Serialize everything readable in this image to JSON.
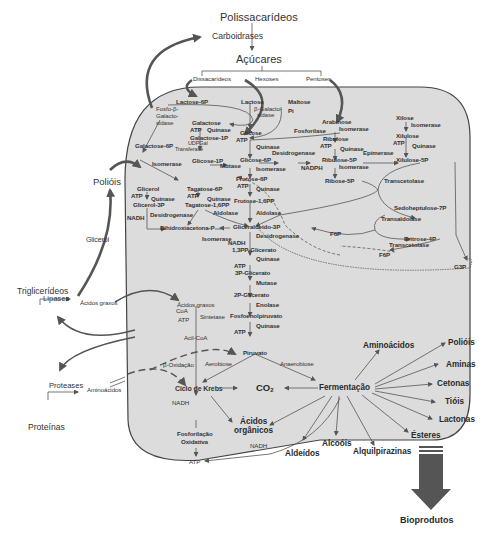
{
  "diagram": {
    "colors": {
      "cell_fill": "#dcdcdc",
      "cell_stroke": "#444444",
      "line": "#555555",
      "arrow_big": "#555555",
      "text": "#2a2a2a"
    },
    "external": {
      "polissacarideos": "Polissacarídeos",
      "carboidrases": "Carboidrases",
      "acucares": "Açúcares",
      "dissacarideos": "Dissacarídeos",
      "hexoses": "Hexoses",
      "pentoses": "Pentoses",
      "poliois": "Polióis",
      "glicerol": "Glicerol",
      "trigliceridios": "Triglicerídeos",
      "lipases": "Lipases",
      "acidos_graxos": "Ácidos graxos",
      "proteases": "Proteases",
      "aminoacidos": "Aminoácidos",
      "proteinas": "Proteínas",
      "bioprodutos": "Bioprodutos"
    },
    "lactose_branch": {
      "lactose_6p": "Lactose-6P",
      "fosfo_beta_galactosidase": [
        "Fosfo-β-",
        "Galacto-",
        "sidase"
      ],
      "galactose": "Galactose",
      "atp1": "ATP",
      "quinase1": "Quinase",
      "galactose_1p": "Galactose-1P",
      "udpgal": "UDPGal",
      "transferase": "Transferase",
      "galactose_6p": "Galactose-6P",
      "isomerase": "Isomerase",
      "lactose": "Lactose",
      "beta_galactosidase": [
        "β-Galacto-",
        "sidase"
      ],
      "maltose": "Maltose",
      "pi": "Pi",
      "fosforilase": "Fosforilase"
    },
    "glycolysis": {
      "glicose": "Glicose",
      "atp_g": "ATP",
      "quinase_g": "Quinase",
      "glicose_1p": "Glicose-1P",
      "mutase_g": "Mutase",
      "glicose_6p": "Glicose-6P",
      "isomerase_g": "Isomerase",
      "frutose_6p": "Frutose-6P",
      "atp_f": "ATP",
      "quinase_f": "Quinase",
      "frutose_16pp": "Frutose-1,6PP",
      "aldolase_f": "Aldolase",
      "gliceraldeido_3p": "Gliceraldeído-3P",
      "desidrogenase_g": "Desidrogenase",
      "nadh_g": "NADH",
      "bpg": "1,3PP-Glicerato",
      "quinase_bpg": "Quinase",
      "atp_bpg": "ATP",
      "pg3": "3P-Glicerato",
      "mutase_pg": "Mutase",
      "pg2": "2P-Glicerato",
      "enolase": "Enolase",
      "pep": "Fosfoenolpiruvato",
      "quinase_pep": "Quinase",
      "atp_pep": "ATP",
      "piruvato": "Piruvato"
    },
    "tagatose_glycerol": {
      "tagatose_6p": "Tagatose-6P",
      "atp_t": "ATP",
      "quinase_t": "Quinase",
      "tagatose_16pp": "Tagatose-1,6PP",
      "aldolase_t": "Aldolase",
      "dihidroxiacetona_p": "Dihidroxiacetona-P",
      "isomerase_d": "Isomerase",
      "glicerol": "Glicerol",
      "atp_gl": "ATP",
      "quinase_gl": "Quinase",
      "glicerol_3p": "Glicerol-3P",
      "nadh_gl": "NADH",
      "desidrogenase_gl": "Desidrogenase"
    },
    "pentose": {
      "desidrogenase_p": "Desidrogenase",
      "nadph": "NADPH",
      "arabinose": "Arabinose",
      "isomerase_a": "Isomerase",
      "ribulose": "Ribulose",
      "atp_r": "ATP",
      "quinase_r": "Quinase",
      "ribulose_5p": "Ribulose-5P",
      "isomerase_r": "Isomerase",
      "ribose_5p": "Ribose-5P",
      "epimerase": "Epimerase",
      "xilose": "Xilose",
      "isomerase_x": "Isomerase",
      "xilulose": "Xilulose",
      "atp_x": "ATP",
      "quinase_x": "Quinase",
      "xilulose_5p": "Xilulose-5P",
      "transcetolase1": "Transcetolase",
      "sedoheptulose_7p": "Sedoheptulose-7P",
      "transaldolase": "Transaldolase",
      "eritrose_4p": "Eritrose-4P",
      "transcetolase2": "Transcetolase",
      "f6p_1": "F6P",
      "f6p_2": "F6P",
      "g3p": "G3P"
    },
    "lipid": {
      "acidos_graxos": "Ácidos graxos",
      "coa": "CoA",
      "atp_l": "ATP",
      "sintetase": "Sintetase",
      "acil_coa": "Acil-CoA",
      "beta_oxidacao": "β-Oxidação"
    },
    "central": {
      "aerobiose": "Aerobiose",
      "anaerobiose": "Anaerobiose",
      "ciclo_krebs": "Ciclo de Krebs",
      "co2": "CO",
      "co2_sub": "2",
      "fermentacao": "Fermentação",
      "nadh_k": "NADH",
      "fosforilacao": [
        "Fosforilação",
        "Oxidativa"
      ],
      "atp_final": "ATP",
      "acidos_organicos": [
        "Ácidos",
        "orgânicos"
      ],
      "nadh_o": "NADH"
    },
    "products": {
      "aminoacidos": "Aminoácidos",
      "poliois": "Polióis",
      "aminas": "Aminas",
      "cetonas": "Cetonas",
      "tiois": "Tióis",
      "lactonas": "Lactonas",
      "esteres": "Ésteres",
      "alquilpirazinas": "Alquilpirazinas",
      "alcoois": "Alcoóis",
      "aldeidos": "Aldeídos"
    }
  }
}
